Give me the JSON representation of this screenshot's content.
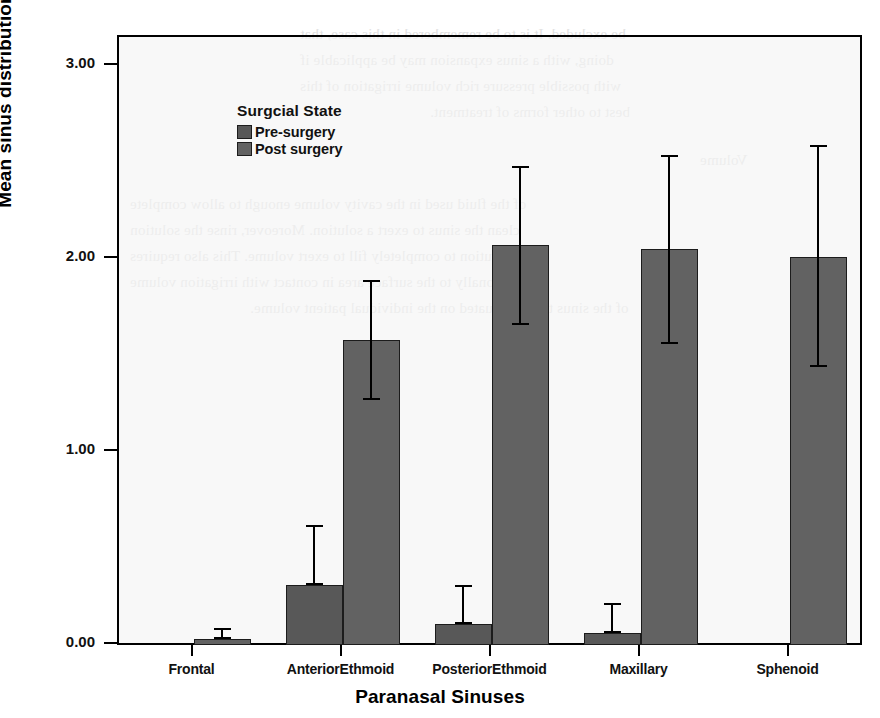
{
  "chart_data": {
    "type": "bar",
    "title": "",
    "xlabel": "Paranasal Sinuses",
    "ylabel": "Mean sinus distribution",
    "categories": [
      "Frontal",
      "AnteriorEthmoid",
      "PosteriorEthmoid",
      "Maxillary",
      "Sphenoid"
    ],
    "ylim": [
      0.0,
      3.15
    ],
    "yticks": [
      "0.00",
      "1.00",
      "2.00",
      "3.00"
    ],
    "ytick_values": [
      0.0,
      1.0,
      2.0,
      3.0
    ],
    "grid": false,
    "legend_position": "inside-upper-left",
    "legend_title": "Surgcial State",
    "error_bars": "95% CI",
    "series": [
      {
        "name": "Pre-surgery",
        "color": "#585858",
        "values": [
          0.0,
          0.31,
          0.11,
          0.06,
          0.0
        ],
        "err_low": [
          0.0,
          0.31,
          0.11,
          0.06,
          0.0
        ],
        "err_high": [
          0.0,
          0.62,
          0.31,
          0.22,
          0.0
        ]
      },
      {
        "name": "Post surgery",
        "color": "#626262",
        "values": [
          0.03,
          1.58,
          2.07,
          2.05,
          2.01
        ],
        "err_low": [
          0.03,
          1.27,
          1.66,
          1.56,
          1.44
        ],
        "err_high": [
          0.09,
          1.89,
          2.48,
          2.54,
          2.59
        ]
      }
    ]
  },
  "legend": {
    "title": "Surgcial State",
    "items": [
      {
        "label": "Pre-surgery",
        "color": "#585858"
      },
      {
        "label": "Post surgery",
        "color": "#626262"
      }
    ]
  },
  "axes": {
    "y_title": "Mean sinus distribution",
    "x_title": "Paranasal Sinuses",
    "y_ticks": [
      "3.00",
      "2.00",
      "1.00",
      "0.00"
    ],
    "x_ticks": [
      "Frontal",
      "AnteriorEthmoid",
      "PosteriorEthmoid",
      "Maxillary",
      "Sphenoid"
    ]
  },
  "scan_artifacts": {
    "top_lines": [
      "be excluded. It is to be remembered in this case, that",
      "doing, with a sinus expansion may be applicable if",
      "with possible pressure rich volume irrigation of this",
      "best to other forms of treatment."
    ],
    "mid_lines": [
      "Volume",
      "of the fluid used in the cavity volume enough to allow complete",
      "clean the sinus to exert a solution. Moreover, rinse the solution",
      "of the solution to completely fill to exert volume. This also requires",
      "proportionally to the surface area in contact with irrigation volume",
      "of the sinus to be evaluated on the individual patient volume."
    ]
  }
}
